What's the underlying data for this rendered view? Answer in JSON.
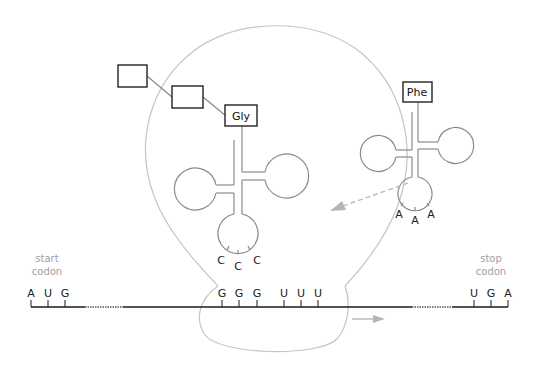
{
  "colors": {
    "ribosome_outline": "#c4c4c4",
    "trna_outline": "#8a8a8a",
    "mrna_line": "#1a1a1a",
    "arrow": "#b5b5b5",
    "label_gray": "#a0a0a0",
    "text": "#222222"
  },
  "labels": {
    "start_line1": "start",
    "start_line2": "codon",
    "stop_line1": "stop",
    "stop_line2": "codon"
  },
  "mrna": {
    "start_codon": [
      "A",
      "U",
      "G"
    ],
    "p_site_codon": [
      "G",
      "G",
      "G"
    ],
    "a_site_codon": [
      "U",
      "U",
      "U"
    ],
    "stop_codon": [
      "U",
      "G",
      "A"
    ]
  },
  "trna_p": {
    "amino_acid": "Gly",
    "anticodon": [
      "C",
      "C",
      "C"
    ]
  },
  "trna_incoming": {
    "amino_acid": "Phe",
    "anticodon": [
      "A",
      "A",
      "A"
    ]
  },
  "peptide_chain": {
    "boxes": [
      "",
      ""
    ]
  }
}
